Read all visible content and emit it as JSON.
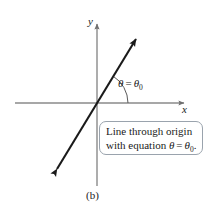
{
  "figure": {
    "panel_label": "(b)",
    "background_color": "#ffffff",
    "axis_color": "#8a8a8a",
    "line_color": "#1a1a1a",
    "box_border_color": "#9aa3ad"
  },
  "axes": {
    "y_label": "y",
    "x_label": "x",
    "origin": {
      "x": 96,
      "y": 103
    },
    "x_axis": {
      "x1": 15,
      "y1": 103,
      "x2": 188,
      "y2": 103,
      "arrow": "right"
    },
    "y_axis": {
      "x1": 97,
      "y1": 186,
      "x2": 97,
      "y2": 20,
      "arrow": "up"
    }
  },
  "line": {
    "name": "theta-equals-theta-zero-line",
    "start": {
      "x": 52,
      "y": 177
    },
    "end": {
      "x": 140,
      "y": 33
    },
    "arrows": "both",
    "angle_degrees": 58
  },
  "angle": {
    "arc_radius": 30,
    "label_theta": "θ",
    "label_equals": "=",
    "label_theta_sub": "θ",
    "label_subscript": "0"
  },
  "caption": {
    "line1": "Line through origin",
    "line2_prefix": "with equation ",
    "line2_theta": "θ",
    "line2_equals": "=",
    "line2_theta_sub": "θ",
    "line2_subscript": "0",
    "line2_suffix": "."
  }
}
